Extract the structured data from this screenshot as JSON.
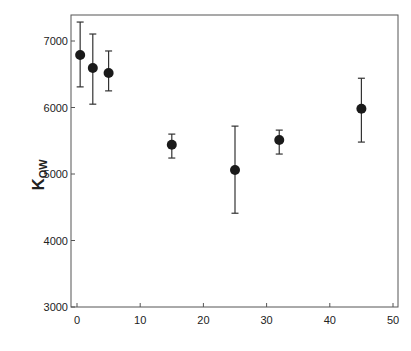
{
  "chart_data": {
    "type": "scatter",
    "title": "",
    "xlabel": "",
    "ylabel": "K",
    "ylabel_subscript": "OW",
    "xlim": [
      0,
      50
    ],
    "ylim": [
      3000,
      7000
    ],
    "xticks": [
      0,
      10,
      20,
      30,
      40,
      50
    ],
    "xtick_labels": [
      "0",
      "10",
      "20",
      "30",
      "40",
      "50"
    ],
    "yticks": [
      3000,
      4000,
      5000,
      6000,
      7000
    ],
    "ytick_labels": [
      "3000",
      "4000",
      "5000",
      "6000",
      "7000"
    ],
    "grid": false,
    "legend": null,
    "series": [
      {
        "name": "Kow",
        "marker": "filled-circle",
        "color": "#1a1a1a",
        "points": [
          {
            "x": 0.5,
            "y": 6790,
            "err_low": 6310,
            "err_high": 7285
          },
          {
            "x": 2.5,
            "y": 6595,
            "err_low": 6050,
            "err_high": 7105
          },
          {
            "x": 5,
            "y": 6520,
            "err_low": 6250,
            "err_high": 6850
          },
          {
            "x": 15,
            "y": 5440,
            "err_low": 5240,
            "err_high": 5600
          },
          {
            "x": 25,
            "y": 5060,
            "err_low": 4410,
            "err_high": 5720
          },
          {
            "x": 32,
            "y": 5510,
            "err_low": 5300,
            "err_high": 5660
          },
          {
            "x": 45,
            "y": 5980,
            "err_low": 5480,
            "err_high": 6440
          }
        ]
      }
    ]
  }
}
